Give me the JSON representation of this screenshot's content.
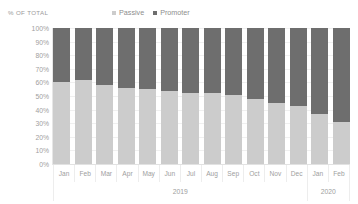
{
  "chart_title": "",
  "axis_title": "% OF TOTAL",
  "legend": {
    "position": "top-center",
    "items": [
      {
        "label": "Passive",
        "color": "#cccccc",
        "marker": "square-swatch"
      },
      {
        "label": "Promoter",
        "color": "#6e6e6e",
        "marker": "square-swatch"
      }
    ]
  },
  "y_axis": {
    "ticks": [
      "100%",
      "90%",
      "80%",
      "70%",
      "60%",
      "50%",
      "40%",
      "30%",
      "20%",
      "10%",
      "0%"
    ]
  },
  "x_axis": {
    "months": [
      "Jan",
      "Feb",
      "Mar",
      "Apr",
      "May",
      "Jun",
      "Jul",
      "Aug",
      "Sep",
      "Oct",
      "Nov",
      "Dec",
      "Jan",
      "Feb"
    ],
    "years": [
      {
        "label": "2019",
        "span": 12
      },
      {
        "label": "2020",
        "span": 2
      }
    ]
  },
  "chart_data": {
    "type": "bar",
    "stacked": true,
    "stack_mode": "percent",
    "title": "",
    "xlabel": "",
    "ylabel": "% OF TOTAL",
    "ylim": [
      0,
      100
    ],
    "grid": true,
    "legend_position": "top-center",
    "categories": [
      "Jan 2019",
      "Feb 2019",
      "Mar 2019",
      "Apr 2019",
      "May 2019",
      "Jun 2019",
      "Jul 2019",
      "Aug 2019",
      "Sep 2019",
      "Oct 2019",
      "Nov 2019",
      "Dec 2019",
      "Jan 2020",
      "Feb 2020"
    ],
    "series": [
      {
        "name": "Passive",
        "color": "#cccccc",
        "values": [
          60,
          62,
          58,
          56,
          55,
          54,
          52,
          52,
          51,
          48,
          45,
          43,
          37,
          31
        ]
      },
      {
        "name": "Promoter",
        "color": "#6e6e6e",
        "values": [
          40,
          38,
          42,
          44,
          45,
          46,
          48,
          48,
          49,
          52,
          55,
          57,
          63,
          69
        ]
      }
    ]
  }
}
